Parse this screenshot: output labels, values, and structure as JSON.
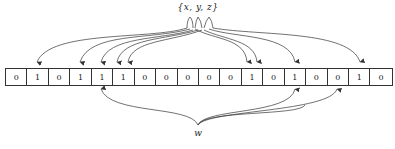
{
  "labels": {
    "top": "{x, y, z}",
    "bottom": "w"
  },
  "bits": [
    "0",
    "1",
    "0",
    "1",
    "1",
    "1",
    "0",
    "0",
    "0",
    "0",
    "0",
    "1",
    "0",
    "1",
    "0",
    "0",
    "1",
    "0"
  ],
  "arrows": {
    "from_top_set": {
      "source_label": "{x, y, z}",
      "target_cell_indices": [
        1,
        3,
        4,
        5,
        5,
        11,
        11,
        13,
        16
      ]
    },
    "from_bottom_w": {
      "source_label": "w",
      "target_cell_indices": [
        4,
        13,
        15
      ]
    }
  },
  "colors": {
    "stroke": "#333333",
    "background": "#ffffff"
  }
}
